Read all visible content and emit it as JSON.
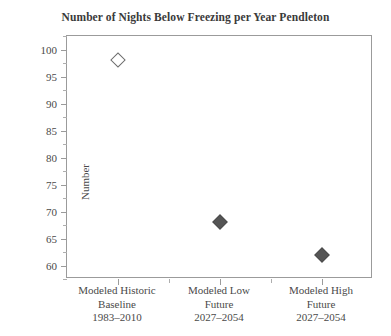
{
  "chart_data": {
    "type": "scatter",
    "title": "Number of Nights Below Freezing per Year Pendleton",
    "xlabel": "",
    "ylabel": "Number",
    "ylim": [
      57.5,
      102.5
    ],
    "ytick_step": 5,
    "yminor_step": 2.5,
    "grid": false,
    "legend": false,
    "categories": [
      "Modeled Historic Baseline 1983–2010",
      "Modeled Low Future 2027–2054",
      "Modeled High Future 2027–2054"
    ],
    "category_lines": [
      [
        "Modeled Historic",
        "Baseline",
        "1983–2010"
      ],
      [
        "Modeled Low",
        "Future",
        "2027–2054"
      ],
      [
        "Modeled High",
        "Future",
        "2027–2054"
      ]
    ],
    "values": [
      98,
      68,
      62
    ],
    "point_styles": [
      "open-diamond",
      "filled-diamond",
      "filled-diamond"
    ],
    "ytick_labels": [
      "60",
      "65",
      "70",
      "75",
      "80",
      "85",
      "90",
      "95",
      "100"
    ],
    "ytick_values": [
      60,
      65,
      70,
      75,
      80,
      85,
      90,
      95,
      100
    ],
    "colors": {
      "marker_open_fill": "#ffffff",
      "marker_open_stroke": "#6e6e6e",
      "marker_filled": "#555555",
      "axis": "#9b9b9b",
      "text": "#4a4a4a",
      "title": "#3a3a3a",
      "background": "#ffffff"
    }
  }
}
